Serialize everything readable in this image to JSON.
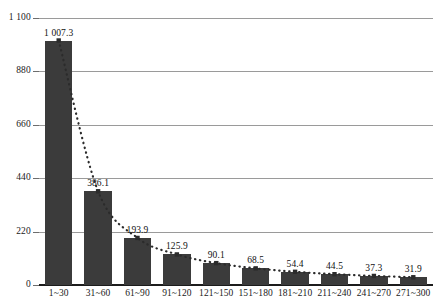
{
  "chart_data": {
    "type": "bar",
    "title": "",
    "xlabel": "",
    "ylabel": "",
    "categories": [
      "1~30",
      "31~60",
      "61~90",
      "91~120",
      "121~150",
      "151~180",
      "181~210",
      "211~240",
      "241~270",
      "271~300"
    ],
    "values": [
      1007.3,
      386.1,
      193.9,
      125.9,
      90.1,
      68.5,
      54.4,
      44.5,
      37.3,
      31.9
    ],
    "value_labels": [
      "1 007.3",
      "386.1",
      "193.9",
      "125.9",
      "90.1",
      "68.5",
      "54.4",
      "44.5",
      "37.3",
      "31.9"
    ],
    "ylim": [
      0,
      1100
    ],
    "yticks": [
      0,
      220,
      440,
      660,
      880,
      1100
    ],
    "ytick_labels": [
      "0",
      "220",
      "440",
      "660",
      "880",
      "1 100"
    ],
    "grid": true,
    "legend": "none",
    "series": [
      {
        "name": "bars",
        "type": "bar",
        "color": "#3b3b3b",
        "values": [
          1007.3,
          386.1,
          193.9,
          125.9,
          90.1,
          68.5,
          54.4,
          44.5,
          37.3,
          31.9
        ]
      },
      {
        "name": "trend",
        "type": "line",
        "style": "dotted",
        "color": "#2b2b2b",
        "values": [
          1007.3,
          386.1,
          193.9,
          125.9,
          90.1,
          68.5,
          54.4,
          44.5,
          37.3,
          31.9
        ]
      }
    ]
  }
}
